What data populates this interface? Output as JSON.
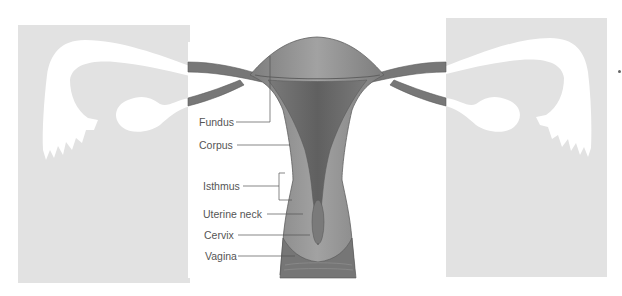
{
  "figure": {
    "labels": [
      {
        "key": "fundus",
        "text": "Fundus"
      },
      {
        "key": "corpus",
        "text": "Corpus"
      },
      {
        "key": "isthmus",
        "text": "Isthmus"
      },
      {
        "key": "uterine_neck",
        "text": "Uterine neck"
      },
      {
        "key": "cervix",
        "text": "Cervix"
      },
      {
        "key": "vagina",
        "text": "Vagina"
      }
    ]
  },
  "colors": {
    "panel": "#e2e2e2",
    "organ": "#8a8a8a",
    "organ_dark": "#6e6e6e",
    "organ_light": "#a0a0a0",
    "tube_silhouette": "#ffffff",
    "leader_line": "#555555"
  }
}
